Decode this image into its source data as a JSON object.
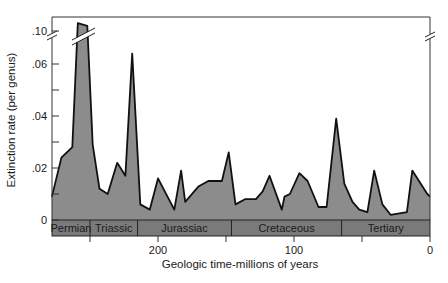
{
  "chart_data": {
    "type": "area",
    "title": "",
    "xlabel": "Geologic time-millions of years",
    "ylabel": "Extinction rate (per genus)",
    "x_reversed": true,
    "xlim": [
      279,
      0
    ],
    "ylim": [
      0,
      0.1
    ],
    "y_axis_break": {
      "between": [
        0.06,
        0.1
      ],
      "note": "broken axis marks on both left and right frame"
    },
    "grid": false,
    "yticks": [
      {
        "value": 0,
        "label": "0"
      },
      {
        "value": 0.01,
        "label": ""
      },
      {
        "value": 0.02,
        "label": ".02"
      },
      {
        "value": 0.03,
        "label": ""
      },
      {
        "value": 0.04,
        "label": ".04"
      },
      {
        "value": 0.05,
        "label": ""
      },
      {
        "value": 0.06,
        "label": ".06"
      },
      {
        "value": 0.1,
        "label": ".10"
      }
    ],
    "xticks": [
      {
        "value": 250,
        "label": ""
      },
      {
        "value": 200,
        "label": "200"
      },
      {
        "value": 150,
        "label": ""
      },
      {
        "value": 100,
        "label": "100"
      },
      {
        "value": 50,
        "label": ""
      },
      {
        "value": 0,
        "label": "0"
      }
    ],
    "periods": [
      {
        "name": "Permian",
        "start": 279,
        "end": 250
      },
      {
        "name": "Triassic",
        "start": 250,
        "end": 215
      },
      {
        "name": "Jurassiac",
        "start": 215,
        "end": 146
      },
      {
        "name": "Cretaceous",
        "start": 146,
        "end": 65
      },
      {
        "name": "Tertiary",
        "start": 65,
        "end": 0
      }
    ],
    "series": [
      {
        "name": "Extinction rate",
        "x": [
          278,
          271,
          263,
          259,
          252,
          248,
          243,
          237,
          230,
          224,
          219,
          213,
          206,
          200,
          188,
          183,
          180,
          170,
          163,
          153,
          148,
          143,
          136,
          128,
          123,
          118,
          109,
          107,
          103,
          96,
          90,
          82,
          76,
          69,
          63,
          57,
          52,
          46,
          41,
          35,
          29,
          17,
          13,
          2,
          0
        ],
        "y": [
          0.009,
          0.024,
          0.028,
          0.103,
          0.102,
          0.029,
          0.012,
          0.01,
          0.022,
          0.017,
          0.064,
          0.006,
          0.004,
          0.016,
          0.004,
          0.019,
          0.007,
          0.013,
          0.015,
          0.015,
          0.026,
          0.006,
          0.008,
          0.008,
          0.011,
          0.017,
          0.004,
          0.009,
          0.01,
          0.018,
          0.015,
          0.005,
          0.005,
          0.039,
          0.014,
          0.007,
          0.004,
          0.003,
          0.019,
          0.006,
          0.002,
          0.003,
          0.019,
          0.01,
          0.009
        ]
      }
    ],
    "colors": {
      "fill": "#8c8c8c",
      "line": "#111111",
      "period_band": "#7a7a7a"
    }
  }
}
